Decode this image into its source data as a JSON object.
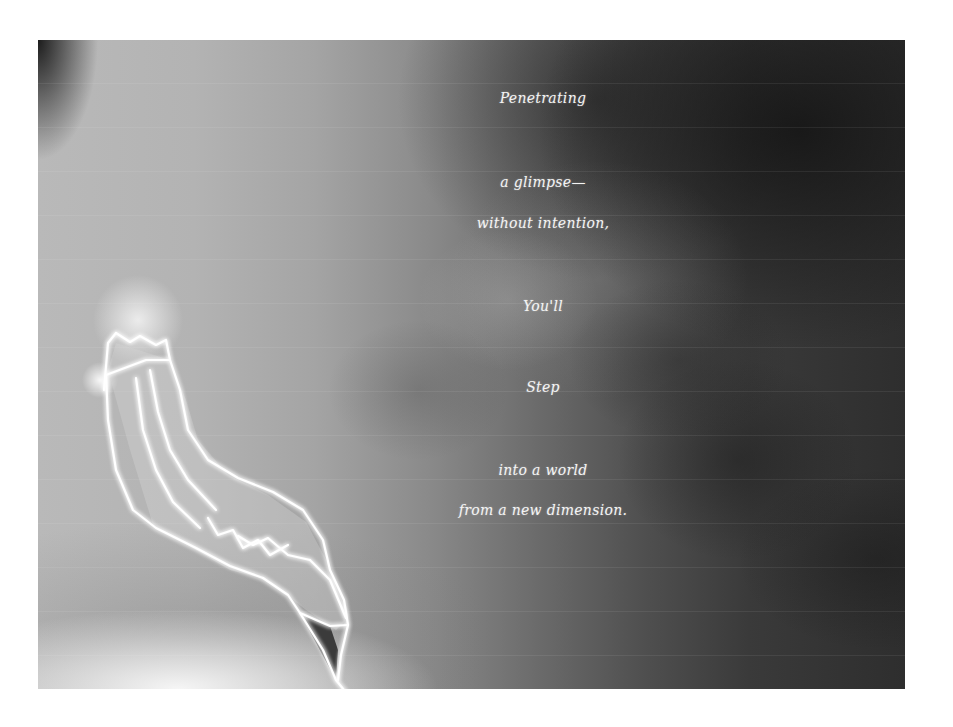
{
  "artwork": {
    "style": "grayscale x-ray style photograph with glowing hand-drawn pencil outline",
    "colors": {
      "light_gray": "#b9b9b9",
      "mid_gray": "#6a6a6a",
      "dark_gray": "#2e2e2e",
      "outline": "#ffffff",
      "text": "#f4f4f4",
      "page_background": "#ffffff"
    },
    "illustration": "pencil-outline"
  },
  "poem": {
    "lines": [
      "Penetrating",
      "a glimpse—",
      "without intention,",
      "You'll",
      "Step",
      "into a world",
      "from a new dimension."
    ]
  }
}
